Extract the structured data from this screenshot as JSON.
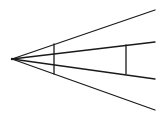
{
  "diagram": {
    "title": "",
    "background": "#ffffff",
    "stroke_color": "#1a1a1a",
    "vertex": {
      "x": 12,
      "y": 59
    },
    "rays": [
      {
        "name": "ray-1",
        "x2": 155,
        "y2": 10
      },
      {
        "name": "ray-2",
        "x2": 155,
        "y2": 42
      },
      {
        "name": "ray-3",
        "x2": 155,
        "y2": 79
      },
      {
        "name": "ray-4",
        "x2": 155,
        "y2": 110
      }
    ],
    "transversals": [
      {
        "name": "transversal-1",
        "x": 54,
        "y1": 44,
        "y2": 74
      },
      {
        "name": "transversal-2",
        "x": 126,
        "y1": 45,
        "y2": 74
      }
    ]
  }
}
